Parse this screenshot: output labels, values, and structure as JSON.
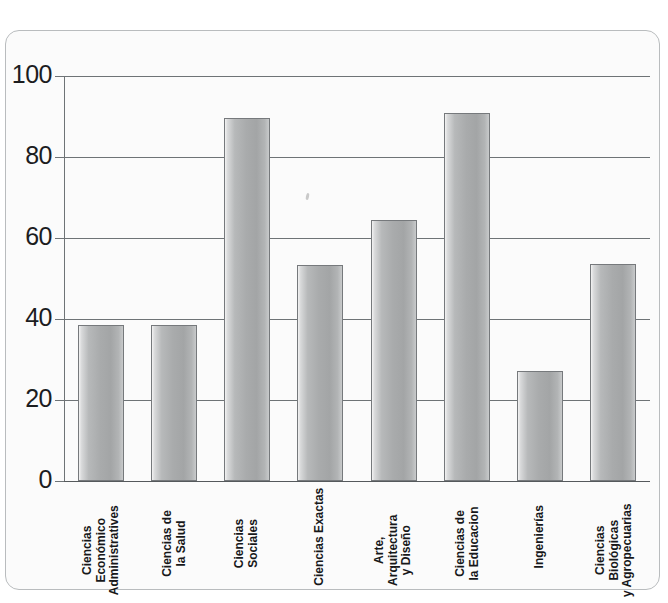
{
  "chart_data": {
    "type": "bar",
    "title": "",
    "xlabel": "",
    "ylabel": "",
    "ylim": [
      0,
      100
    ],
    "yticks": [
      0,
      20,
      40,
      60,
      80,
      100
    ],
    "grid": true,
    "legend": "none",
    "categories": [
      "Ciencias Económico Administrativas",
      "Ciencias de la Salud",
      "Ciencias Sociales",
      "Ciencias Exactas",
      "Arte, Arquitectura y Diseño",
      "Ciencias de la Educacion",
      "Ingenierías",
      "Ciencias Biológicas y Agropecuarias"
    ],
    "category_lines": [
      [
        "Ciencias",
        "Económico",
        "Administratives"
      ],
      [
        "Ciencias de",
        "la Salud"
      ],
      [
        "Ciencias",
        "Sociales"
      ],
      [
        "Ciencias Exactas"
      ],
      [
        "Arte,",
        "Arquitectura",
        "y Diseño"
      ],
      [
        "Ciencias de",
        "la Educacion"
      ],
      [
        "Ingenierías"
      ],
      [
        "Ciencias",
        "Biológicas",
        "y Agropecuarias"
      ]
    ],
    "values": [
      38.5,
      38.6,
      89.6,
      53.4,
      64.4,
      90.9,
      27.2,
      53.6
    ]
  },
  "colors": {
    "bar_light": "#f2f2f2",
    "bar_mid": "#b7b9ba",
    "bar_dark": "#a3a5a6",
    "bar_border": "#76797c",
    "grid": "#6e7376",
    "axis": "#6e7376",
    "text": "#17181a",
    "frame_border": "#b9bcbe",
    "background": "#fbfbfb"
  }
}
